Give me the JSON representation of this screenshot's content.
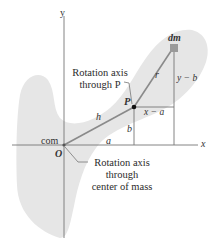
{
  "diagram": {
    "axes": {
      "x_label": "x",
      "y_label": "y",
      "origin_label": "O"
    },
    "points": {
      "com_label": "com",
      "P_label": "P",
      "mass_element_label": "dm"
    },
    "segments": {
      "h_label": "h",
      "r_label": "r",
      "a_label": "a",
      "b_label": "b",
      "x_minus_a_label": "x − a",
      "y_minus_b_label": "y − b"
    },
    "callouts": {
      "axis_P": [
        "Rotation axis",
        "through P"
      ],
      "axis_com": [
        "Rotation axis",
        "through",
        "center of mass"
      ]
    },
    "colors": {
      "body_fill": "#e6e6e6",
      "line": "#8a8a8a",
      "axis": "#777777",
      "point": "#111111",
      "dm_fill": "#9a9a9a"
    }
  }
}
